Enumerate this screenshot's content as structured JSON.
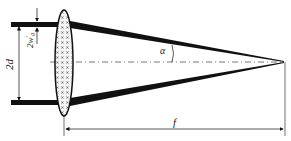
{
  "diagram": {
    "labels": {
      "beam_separation": "2d",
      "beam_waist": "2w",
      "beam_waist_prime": "′",
      "beam_waist_sub": "0",
      "half_angle": "α",
      "focal_length": "f"
    },
    "colors": {
      "ink": "#111111",
      "lens_fill": "#f4f4f4",
      "axis": "#555555"
    }
  }
}
